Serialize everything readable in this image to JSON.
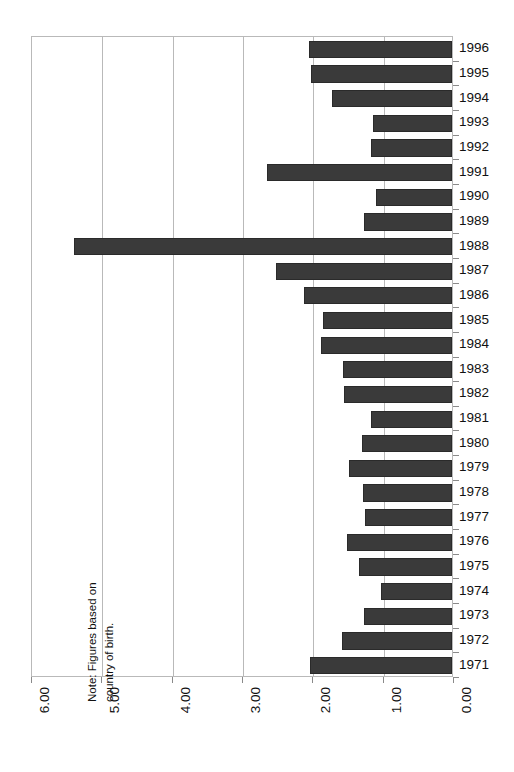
{
  "chart_data": {
    "type": "bar",
    "orientation": "horizontal",
    "title": "",
    "subtitle": "",
    "xlabel": "",
    "ylabel": "",
    "xlim": [
      6.0,
      0.0
    ],
    "xaxis_reversed": true,
    "grid": true,
    "legend": null,
    "annotations": [
      "Note: Figures based on country of birth."
    ],
    "xticklabels": [
      "6.00",
      "5.00",
      "4.00",
      "3.00",
      "2.00",
      "1.00",
      "0.00"
    ],
    "xticks": [
      6.0,
      5.0,
      4.0,
      3.0,
      2.0,
      1.0,
      0.0
    ],
    "categories": [
      "1996",
      "1995",
      "1994",
      "1993",
      "1992",
      "1991",
      "1990",
      "1989",
      "1988",
      "1987",
      "1986",
      "1985",
      "1984",
      "1983",
      "1982",
      "1981",
      "1980",
      "1979",
      "1978",
      "1977",
      "1976",
      "1975",
      "1974",
      "1973",
      "1972",
      "1971"
    ],
    "values": [
      2.04,
      2.0,
      1.7,
      1.13,
      1.15,
      2.63,
      1.08,
      1.25,
      5.38,
      2.5,
      2.1,
      1.83,
      1.86,
      1.55,
      1.53,
      1.15,
      1.28,
      1.46,
      1.26,
      1.24,
      1.49,
      1.32,
      1.01,
      1.25,
      1.56,
      2.02
    ],
    "bar_color": "#3a3a3a",
    "bar_edge_color": "#2a2a2a",
    "grid_color": "#b9b9b9",
    "background_color": "#ffffff",
    "text_color": "#111111"
  },
  "note": {
    "text": "Note: Figures based on\ncountry of birth."
  }
}
